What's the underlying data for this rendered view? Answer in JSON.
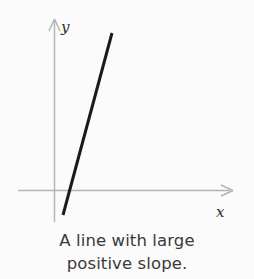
{
  "figure": {
    "kind": "coordinate-plane-line-graph",
    "background_color": "#fbfbfb",
    "axes": {
      "axis_color": "#b3b3b3",
      "x_axis": {
        "label": "x",
        "start_x": 18,
        "end_x": 234,
        "y": 190,
        "arrow": "right"
      },
      "y_axis": {
        "label": "y",
        "x": 54,
        "top_y": 19,
        "bottom_y": 222,
        "arrow": "up"
      }
    },
    "line": {
      "description": "steep straight line with large positive slope",
      "color": "#1a1a1a",
      "stroke_width": 3,
      "x1": 112,
      "y1": 33,
      "x2": 63,
      "y2": 215,
      "x_intercept_px": 70,
      "slope_sign": "positive"
    }
  },
  "caption": {
    "line1": "A line with large",
    "line2": "positive slope.",
    "full_text": "A line with large positive slope.",
    "color": "#3a3a3a"
  }
}
